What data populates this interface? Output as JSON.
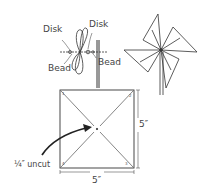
{
  "diagram": {
    "type": "instructional-line-drawing",
    "assembly_labels": {
      "disk_left": "Disk",
      "disk_right": "Disk",
      "bead_left": "Bead",
      "bead_right": "Bead"
    },
    "template": {
      "side_right_label": "5″",
      "side_bottom_label": "5″",
      "center_note": "¼″ uncut",
      "corner_numbers": [
        "1",
        "2",
        "3",
        "4"
      ]
    },
    "colors": {
      "line": "#333333",
      "text": "#444444",
      "background": "#ffffff"
    }
  }
}
